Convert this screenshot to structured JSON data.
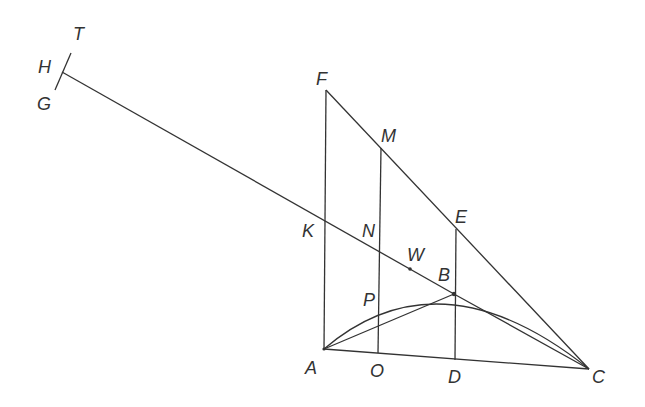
{
  "diagram": {
    "type": "geometric-construction",
    "stroke_color": "#333333",
    "points": {
      "A": [
        324,
        349
      ],
      "B": [
        454,
        294
      ],
      "C": [
        589,
        369
      ],
      "D": [
        455,
        360
      ],
      "E": [
        456,
        229
      ],
      "F": [
        326,
        90
      ],
      "M": [
        381,
        148
      ],
      "N": [
        380,
        251
      ],
      "O": [
        378,
        353
      ],
      "P": [
        379,
        303
      ],
      "K": [
        324,
        220
      ],
      "W": [
        410,
        269
      ],
      "H": [
        62,
        72
      ],
      "T": [
        71,
        53
      ],
      "G": [
        55,
        90
      ]
    },
    "labels": [
      {
        "id": "T",
        "text": "T",
        "x": 73,
        "y": 25
      },
      {
        "id": "H",
        "text": "H",
        "x": 38,
        "y": 58
      },
      {
        "id": "G",
        "text": "G",
        "x": 37,
        "y": 95
      },
      {
        "id": "F",
        "text": "F",
        "x": 316,
        "y": 70
      },
      {
        "id": "M",
        "text": "M",
        "x": 381,
        "y": 127
      },
      {
        "id": "E",
        "text": "E",
        "x": 455,
        "y": 208
      },
      {
        "id": "K",
        "text": "K",
        "x": 302,
        "y": 222
      },
      {
        "id": "N",
        "text": "N",
        "x": 362,
        "y": 222
      },
      {
        "id": "W",
        "text": "W",
        "x": 407,
        "y": 246
      },
      {
        "id": "B",
        "text": "B",
        "x": 438,
        "y": 266
      },
      {
        "id": "P",
        "text": "P",
        "x": 363,
        "y": 291
      },
      {
        "id": "A",
        "text": "A",
        "x": 305,
        "y": 359
      },
      {
        "id": "O",
        "text": "O",
        "x": 370,
        "y": 362
      },
      {
        "id": "D",
        "text": "D",
        "x": 448,
        "y": 368
      },
      {
        "id": "C",
        "text": "C",
        "x": 592,
        "y": 368
      }
    ]
  }
}
